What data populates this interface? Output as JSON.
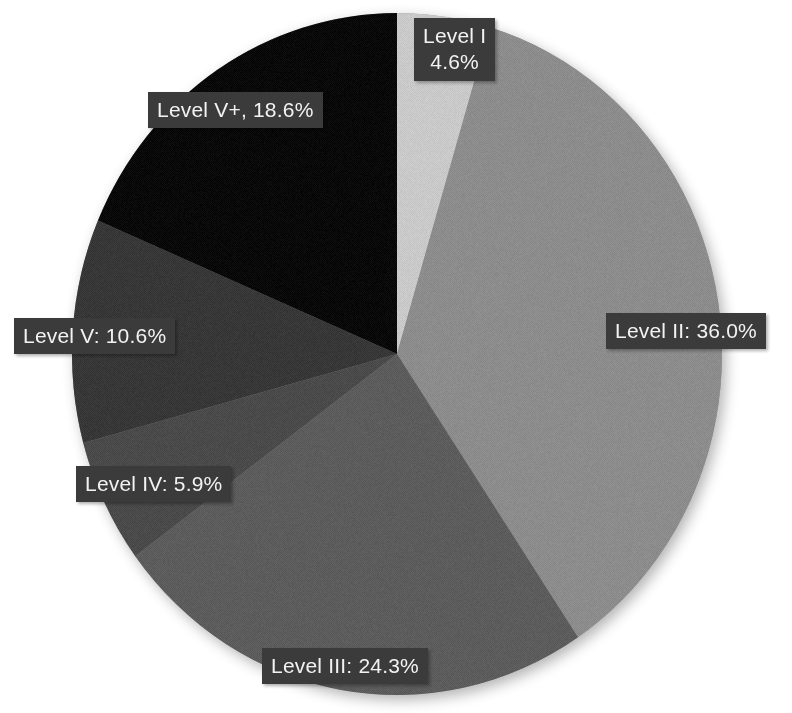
{
  "chart_data": {
    "type": "pie",
    "title": "",
    "subtitle": "",
    "xlabel": "",
    "ylabel": "",
    "legend_position": "none",
    "grid": false,
    "background_color": "#ffffff",
    "label_box_color": "#3b3b3b",
    "label_text_color": "#f2f2f2",
    "start_angle_deg": -90,
    "direction": "clockwise",
    "center": {
      "x": 397,
      "y": 354
    },
    "radius": {
      "x": 325,
      "y": 341
    },
    "categories": [
      "Level I",
      "Level II",
      "Level III",
      "Level IV",
      "Level V",
      "Level V+"
    ],
    "values": [
      4.6,
      36.0,
      24.3,
      5.9,
      10.6,
      18.6
    ],
    "units": "%",
    "colors": [
      "#c9c9c9",
      "#8c8c8c",
      "#5c5c5c",
      "#4a4a4a",
      "#373737",
      "#090909"
    ],
    "slices": [
      {
        "label": "Level I",
        "value": 4.6,
        "display": "Level I\n4.6%",
        "color": "#c9c9c9"
      },
      {
        "label": "Level II",
        "value": 36.0,
        "display": "Level II: 36.0%",
        "color": "#8c8c8c"
      },
      {
        "label": "Level III",
        "value": 24.3,
        "display": "Level III: 24.3%",
        "color": "#5c5c5c"
      },
      {
        "label": "Level IV",
        "value": 5.9,
        "display": "Level IV: 5.9%",
        "color": "#4a4a4a"
      },
      {
        "label": "Level V",
        "value": 10.6,
        "display": "Level V: 10.6%",
        "color": "#373737"
      },
      {
        "label": "Level V+",
        "value": 18.6,
        "display": "Level V+, 18.6%",
        "color": "#090909"
      }
    ],
    "labels": [
      {
        "text": "Level I\n4.6%",
        "x": 414,
        "y": 18,
        "lines": 2
      },
      {
        "text": "Level II: 36.0%",
        "x": 606,
        "y": 313,
        "lines": 1
      },
      {
        "text": "Level III: 24.3%",
        "x": 262,
        "y": 648,
        "lines": 1
      },
      {
        "text": "Level IV: 5.9%",
        "x": 76,
        "y": 466,
        "lines": 1
      },
      {
        "text": "Level V: 10.6%",
        "x": 14,
        "y": 318,
        "lines": 1
      },
      {
        "text": "Level V+, 18.6%",
        "x": 148,
        "y": 92,
        "lines": 1
      }
    ]
  }
}
